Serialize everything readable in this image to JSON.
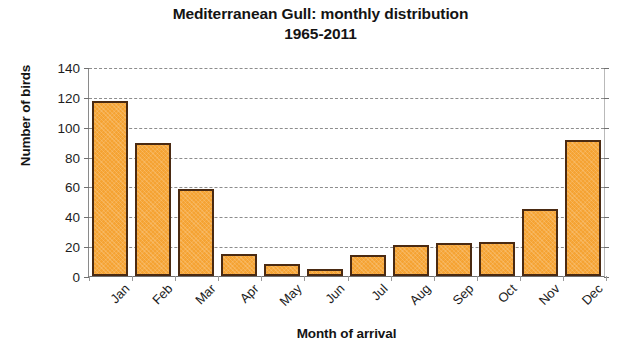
{
  "chart_data": {
    "type": "bar",
    "title": "Mediterranean Gull: monthly distribution 1965-2011",
    "title_line1": "Mediterranean Gull: monthly distribution",
    "title_line2": "1965-2011",
    "xlabel": "Month of arrival",
    "ylabel": "Number of birds",
    "categories": [
      "Jan",
      "Feb",
      "Mar",
      "Apr",
      "May",
      "Jun",
      "Jul",
      "Aug",
      "Sep",
      "Oct",
      "Nov",
      "Dec"
    ],
    "values": [
      117,
      89,
      58,
      15,
      8,
      5,
      14,
      21,
      22,
      23,
      45,
      91
    ],
    "ylim": [
      0,
      140
    ],
    "ytick_step": 20,
    "ytick_labels": [
      "140",
      "120",
      "100",
      "80",
      "60",
      "40",
      "20",
      "0"
    ],
    "ytick_values": [
      140,
      120,
      100,
      80,
      60,
      40,
      20,
      0
    ],
    "grid": true,
    "grid_axis": "y",
    "grid_style": "dashed",
    "legend": false,
    "bar_color": "#F5A333",
    "bar_border_color": "#4A2A12",
    "grid_color": "#8D8D8D",
    "axis_color": "#707070",
    "background_color": "#FFFFFF",
    "xtick_rotation": -45
  }
}
